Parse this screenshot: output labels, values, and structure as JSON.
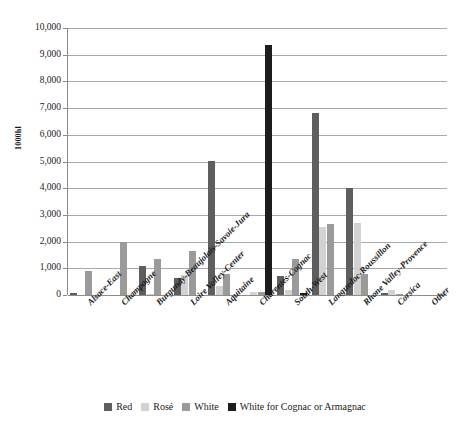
{
  "chart_data": {
    "type": "bar",
    "title": "",
    "xlabel": "",
    "ylabel": "1000hl",
    "ylim": [
      0,
      10000
    ],
    "ytick_step": 1000,
    "grid": true,
    "legend_position": "bottom",
    "categories": [
      "Alsace-East",
      "Champagne",
      "Burgundy-Beaujolais-Savoie-Jura",
      "Loire Valley-Center",
      "Aquitaine",
      "Charentes-Cognac",
      "South-West",
      "Languedoc-Roussillon",
      "Rhone Valley-Provence",
      "Corsica",
      "Other"
    ],
    "ytick_labels": [
      "0",
      "1,000",
      "2,000",
      "3,000",
      "4,000",
      "5,000",
      "6,000",
      "7,000",
      "8,000",
      "9,000",
      "10,000"
    ],
    "series": [
      {
        "name": "Red",
        "color": "#5e5e5e",
        "values": [
          60,
          0,
          1080,
          650,
          5020,
          0,
          700,
          6800,
          4000,
          60,
          0
        ]
      },
      {
        "name": "Rosé",
        "color": "#d2d2d2",
        "values": [
          0,
          0,
          30,
          760,
          350,
          130,
          190,
          2550,
          2700,
          190,
          0
        ]
      },
      {
        "name": "White",
        "color": "#9a9a9a",
        "values": [
          890,
          2000,
          1360,
          1660,
          790,
          100,
          1350,
          2650,
          780,
          50,
          0
        ]
      },
      {
        "name": "White for Cognac or Armagnac",
        "color": "#1c1c1c",
        "values": [
          0,
          0,
          0,
          0,
          0,
          9350,
          80,
          0,
          0,
          0,
          0
        ]
      }
    ]
  },
  "legend": {
    "items": [
      {
        "label": "Red",
        "color": "#5e5e5e"
      },
      {
        "label": "Rosé",
        "color": "#d2d2d2"
      },
      {
        "label": "White",
        "color": "#9a9a9a"
      },
      {
        "label": "White for Cognac or Armagnac",
        "color": "#1c1c1c"
      }
    ]
  }
}
